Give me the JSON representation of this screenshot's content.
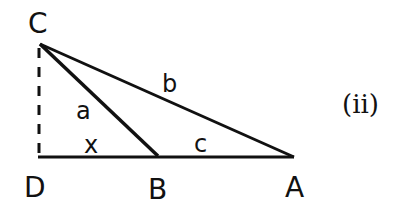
{
  "figure": {
    "tag": "(ii)",
    "vertices": {
      "C": "C",
      "D": "D",
      "B": "B",
      "A": "A"
    },
    "sides": {
      "a": "a",
      "b": "b",
      "c": "c",
      "x": "x"
    },
    "colors": {
      "stroke": "#111111",
      "background": "#ffffff"
    }
  }
}
